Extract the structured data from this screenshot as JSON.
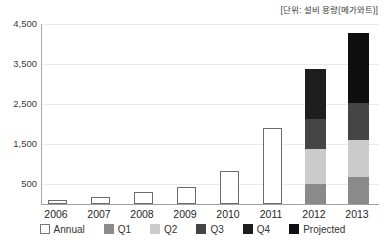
{
  "unit_label": "[단위: 설비 용량(메가와트)]",
  "chart_data": {
    "type": "bar",
    "stacked": true,
    "title": "[단위: 설비 용량(메가와트)]",
    "unit": "설비 용량(메가와트)",
    "xlabel": "",
    "ylabel": "",
    "categories": [
      "2006",
      "2007",
      "2008",
      "2009",
      "2010",
      "2011",
      "2012",
      "2013"
    ],
    "series": [
      {
        "name": "Annual",
        "style": "outlined",
        "fill": "#ffffff",
        "border": "#6b6b6b",
        "values": [
          100,
          165,
          290,
          420,
          830,
          1900,
          null,
          null
        ]
      },
      {
        "name": "Q1",
        "style": "solid",
        "fill": "#8a8a8a",
        "values": [
          null,
          null,
          null,
          null,
          null,
          null,
          490,
          680
        ]
      },
      {
        "name": "Q2",
        "style": "solid",
        "fill": "#cbcbcb",
        "values": [
          null,
          null,
          null,
          null,
          null,
          null,
          885,
          920
        ]
      },
      {
        "name": "Q3",
        "style": "solid",
        "fill": "#454545",
        "values": [
          null,
          null,
          null,
          null,
          null,
          null,
          750,
          930
        ]
      },
      {
        "name": "Q4",
        "style": "solid",
        "fill": "#1e1e1e",
        "values": [
          null,
          null,
          null,
          null,
          null,
          null,
          1250,
          null
        ]
      },
      {
        "name": "Projected",
        "style": "solid",
        "fill": "#0f0f0f",
        "values": [
          null,
          null,
          null,
          null,
          null,
          null,
          null,
          1740
        ]
      }
    ],
    "stack_totals": {
      "2012": 3375,
      "2013": 4270
    },
    "ylim": [
      0,
      4500
    ],
    "yticks": [
      4500,
      3500,
      2500,
      1500,
      500
    ],
    "ytick_labels": [
      "4,500",
      "3,500",
      "2,500",
      "1,500",
      "500"
    ],
    "grid": "horizontal",
    "legend_position": "bottom",
    "legend_labels": [
      "Annual",
      "Q1",
      "Q2",
      "Q3",
      "Q4",
      "Projected"
    ]
  },
  "colors": {
    "background": "#ffffff",
    "gridline": "#e9e9e9",
    "axis": "#a0a0a0",
    "text": "#333333",
    "q1": "#8a8a8a",
    "q2": "#cbcbcb",
    "q3": "#454545",
    "q4": "#1e1e1e",
    "projected": "#0f0f0f",
    "annual_border": "#6b6b6b"
  }
}
